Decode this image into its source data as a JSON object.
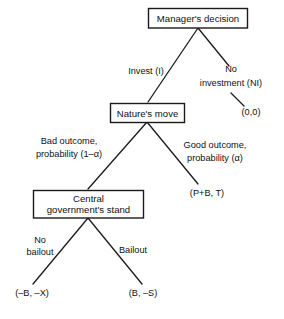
{
  "diagram": {
    "type": "decision-tree",
    "nodes": {
      "manager": "Manager's decision",
      "nature": "Nature's move",
      "government_line1": "Central",
      "government_line2": "government's stand"
    },
    "edges": {
      "invest": "Invest (I)",
      "no_investment_line1": "No",
      "no_investment_line2": "investment (NI)",
      "bad_outcome_line1": "Bad outcome,",
      "bad_outcome_line2": "probability  (1–α)",
      "good_outcome_line1": "Good outcome,",
      "good_outcome_line2": "probability  (α)",
      "no_bailout_line1": "No",
      "no_bailout_line2": "bailout",
      "bailout": "Bailout"
    },
    "payoffs": {
      "no_investment": "(0,0)",
      "good_outcome": "(P+B, T)",
      "no_bailout": "(–B, –X)",
      "bailout": "(B, –S)"
    },
    "colors": {
      "line": "#1a1a1a",
      "text": "#111111",
      "background": "#ffffff"
    }
  }
}
